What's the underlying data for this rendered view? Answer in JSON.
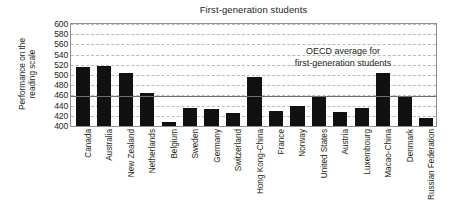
{
  "chart_data": {
    "type": "bar",
    "title": "First-generation students",
    "xlabel": "",
    "ylabel": "Performance on the reading scale",
    "ylabel_lines": [
      "Performance on the",
      "reading scale"
    ],
    "ylim": [
      400,
      600
    ],
    "ytick_step": 20,
    "yticks": [
      600,
      580,
      560,
      540,
      520,
      500,
      480,
      460,
      440,
      420,
      400
    ],
    "grid": true,
    "legend": "none",
    "bar_color": "#111111",
    "gridline_color": "#b9b9b9",
    "frame_color": "#8d8d8d",
    "reference_line": {
      "value": 458,
      "color": "#6f6f6f",
      "label_lines": [
        "OECD average for",
        "first-generation students"
      ]
    },
    "categories": [
      "Canada",
      "Australia",
      "New Zealand",
      "Netherlands",
      "Belgium",
      "Sweden",
      "Germany",
      "Switzerland",
      "Hong Kong-China",
      "France",
      "Norway",
      "United States",
      "Austria",
      "Luxembourg",
      "Macao-China",
      "Denmark",
      "Russian Federation"
    ],
    "values": [
      515,
      518,
      503,
      465,
      407,
      435,
      433,
      425,
      496,
      429,
      439,
      457,
      427,
      435,
      503,
      459,
      416
    ]
  }
}
